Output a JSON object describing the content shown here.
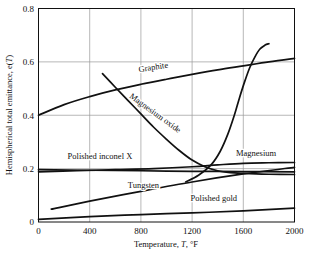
{
  "chart_data": {
    "type": "line",
    "title": "",
    "xlabel": "Temperature, T, °F",
    "ylabel": "Hemispherical total emittance, e(T)",
    "xlim": [
      0,
      2000
    ],
    "ylim": [
      0,
      0.8
    ],
    "xticks": [
      "0",
      "400",
      "800",
      "1200",
      "1600",
      "2000"
    ],
    "xtick_values": [
      0,
      400,
      800,
      1200,
      1600,
      2000
    ],
    "yticks": [
      "0",
      "0.2",
      "0.4",
      "0.6",
      "0.8"
    ],
    "ytick_values": [
      0,
      0.2,
      0.4,
      0.6,
      0.8
    ],
    "grid": true,
    "legend_position": "inline-labels",
    "series": [
      {
        "name": "Graphite",
        "label": "Graphite",
        "points": [
          [
            0,
            0.4
          ],
          [
            200,
            0.44
          ],
          [
            400,
            0.47
          ],
          [
            600,
            0.495
          ],
          [
            800,
            0.516
          ],
          [
            1000,
            0.535
          ],
          [
            1200,
            0.553
          ],
          [
            1400,
            0.57
          ],
          [
            1600,
            0.585
          ],
          [
            1800,
            0.6
          ],
          [
            2000,
            0.613
          ]
        ]
      },
      {
        "name": "Magnesium oxide",
        "label": "Magnesium oxide",
        "points": [
          [
            500,
            0.556
          ],
          [
            600,
            0.505
          ],
          [
            700,
            0.455
          ],
          [
            800,
            0.405
          ],
          [
            900,
            0.355
          ],
          [
            1000,
            0.31
          ],
          [
            1100,
            0.268
          ],
          [
            1200,
            0.232
          ],
          [
            1300,
            0.207
          ],
          [
            1400,
            0.192
          ],
          [
            1500,
            0.185
          ],
          [
            1600,
            0.182
          ],
          [
            1700,
            0.18
          ],
          [
            1800,
            0.179
          ],
          [
            2000,
            0.178
          ]
        ]
      },
      {
        "name": "Magnesium oxide rising branch",
        "label": "",
        "points": [
          [
            1150,
            0.15
          ],
          [
            1250,
            0.175
          ],
          [
            1350,
            0.215
          ],
          [
            1420,
            0.265
          ],
          [
            1480,
            0.33
          ],
          [
            1530,
            0.4
          ],
          [
            1570,
            0.465
          ],
          [
            1610,
            0.525
          ],
          [
            1650,
            0.578
          ],
          [
            1690,
            0.618
          ],
          [
            1730,
            0.648
          ],
          [
            1770,
            0.663
          ],
          [
            1800,
            0.668
          ]
        ]
      },
      {
        "name": "Polished inconel X",
        "label": "Polished inconel X",
        "points": [
          [
            0,
            0.196
          ],
          [
            400,
            0.194
          ],
          [
            800,
            0.192
          ],
          [
            1200,
            0.19
          ],
          [
            1600,
            0.189
          ],
          [
            2000,
            0.188
          ]
        ]
      },
      {
        "name": "Magnesium",
        "label": "Magnesium",
        "points": [
          [
            0,
            0.188
          ],
          [
            300,
            0.192
          ],
          [
            600,
            0.196
          ],
          [
            900,
            0.2
          ],
          [
            1200,
            0.207
          ],
          [
            1400,
            0.214
          ],
          [
            1600,
            0.22
          ],
          [
            1800,
            0.222
          ],
          [
            2000,
            0.223
          ]
        ]
      },
      {
        "name": "Tungsten",
        "label": "Tungsten",
        "points": [
          [
            100,
            0.048
          ],
          [
            400,
            0.078
          ],
          [
            800,
            0.115
          ],
          [
            1200,
            0.15
          ],
          [
            1600,
            0.18
          ],
          [
            2000,
            0.205
          ]
        ]
      },
      {
        "name": "Polished gold",
        "label": "Polished gold",
        "points": [
          [
            0,
            0.01
          ],
          [
            400,
            0.02
          ],
          [
            800,
            0.028
          ],
          [
            1200,
            0.034
          ],
          [
            1600,
            0.042
          ],
          [
            2000,
            0.052
          ]
        ]
      }
    ],
    "annotations": [
      {
        "text": "Graphite",
        "x": 900,
        "y": 0.57,
        "rotation": -9
      },
      {
        "text": "Magnesium oxide",
        "x": 900,
        "y": 0.4,
        "rotation": 36
      },
      {
        "text": "Polished inconel X",
        "x": 480,
        "y": 0.235,
        "rotation": 0
      },
      {
        "text": "Magnesium",
        "x": 1700,
        "y": 0.248,
        "rotation": 0
      },
      {
        "text": "Tungsten",
        "x": 820,
        "y": 0.128,
        "rotation": 0
      },
      {
        "text": "Polished gold",
        "x": 1370,
        "y": 0.078,
        "rotation": 0
      }
    ]
  },
  "axes": {
    "x_axis_label": "Temperature, T, °F",
    "x_axis_label_parts": {
      "lead": "Temperature, ",
      "symbol": "T",
      "unit": ", °F"
    },
    "y_axis_label": "Hemispherical total emittance, e(T)",
    "y_axis_label_parts": {
      "lead": "Hemispherical total emittance, e(",
      "symbol": "T",
      "tail": ")"
    }
  },
  "colors": {
    "curve": "#111111",
    "grid": "#9a9a9a",
    "frame": "#111111",
    "background": "#ffffff",
    "text": "#111111"
  }
}
